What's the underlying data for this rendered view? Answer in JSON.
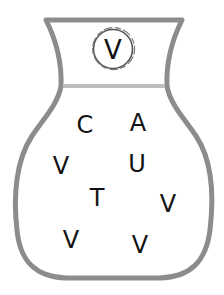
{
  "puzzle": {
    "vase": {
      "outline_color": "#8c8c8c",
      "neck_band_color": "#bdbdbd"
    },
    "key_letter": {
      "label": "V",
      "x": 113,
      "y": 50,
      "size": 26
    },
    "letters": [
      {
        "label": "C",
        "x": 85,
        "y": 125,
        "size": 24
      },
      {
        "label": "A",
        "x": 138,
        "y": 123,
        "size": 24
      },
      {
        "label": "V",
        "x": 61,
        "y": 166,
        "size": 24
      },
      {
        "label": "U",
        "x": 137,
        "y": 164,
        "size": 24
      },
      {
        "label": "T",
        "x": 97,
        "y": 198,
        "size": 24
      },
      {
        "label": "V",
        "x": 168,
        "y": 204,
        "size": 24
      },
      {
        "label": "V",
        "x": 71,
        "y": 240,
        "size": 24
      },
      {
        "label": "V",
        "x": 140,
        "y": 245,
        "size": 24
      }
    ]
  }
}
